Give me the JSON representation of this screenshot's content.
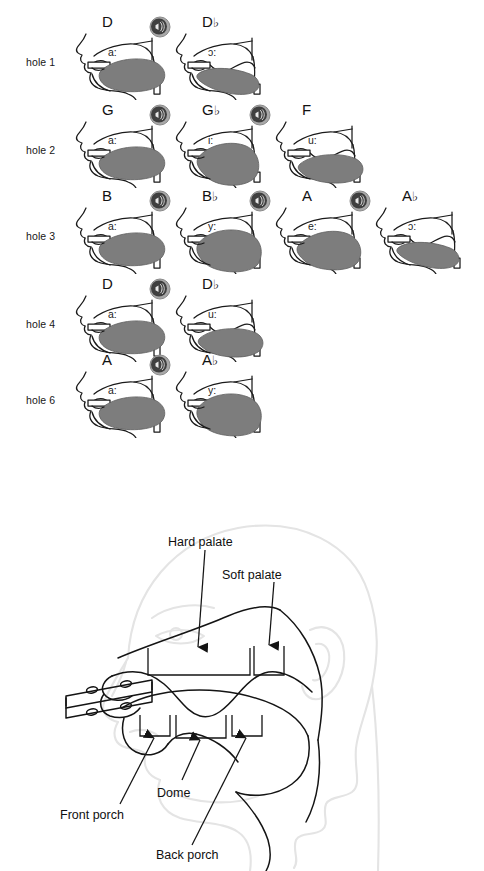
{
  "chart_data": {
    "type": "table",
    "row_header_label": "hole",
    "rows": [
      {
        "hole_label": "hole 1",
        "cells": [
          {
            "note": "D",
            "flat": false,
            "vowel": "a:",
            "speaker": false,
            "speaker_icon": "speaker-icon"
          },
          {
            "note": "D",
            "flat": true,
            "vowel": "ɔ:",
            "speaker": true,
            "speaker_icon": "speaker-icon"
          }
        ]
      },
      {
        "hole_label": "hole 2",
        "cells": [
          {
            "note": "G",
            "flat": false,
            "vowel": "a:",
            "speaker": false,
            "speaker_icon": "speaker-icon"
          },
          {
            "note": "G",
            "flat": true,
            "vowel": "i:",
            "speaker": true,
            "speaker_icon": "speaker-icon"
          },
          {
            "note": "F",
            "flat": false,
            "vowel": "u:",
            "speaker": true,
            "speaker_icon": "speaker-icon"
          }
        ]
      },
      {
        "hole_label": "hole 3",
        "cells": [
          {
            "note": "B",
            "flat": false,
            "vowel": "a:",
            "speaker": false,
            "speaker_icon": "speaker-icon"
          },
          {
            "note": "B",
            "flat": true,
            "vowel": "y:",
            "speaker": true,
            "speaker_icon": "speaker-icon"
          },
          {
            "note": "A",
            "flat": false,
            "vowel": "e:",
            "speaker": true,
            "speaker_icon": "speaker-icon"
          },
          {
            "note": "A",
            "flat": true,
            "vowel": "ɔ:",
            "speaker": true,
            "speaker_icon": "speaker-icon"
          }
        ]
      },
      {
        "hole_label": "hole 4",
        "cells": [
          {
            "note": "D",
            "flat": false,
            "vowel": "a:",
            "speaker": false,
            "speaker_icon": "speaker-icon"
          },
          {
            "note": "D",
            "flat": true,
            "vowel": "u:",
            "speaker": true,
            "speaker_icon": "speaker-icon"
          }
        ]
      },
      {
        "hole_label": "hole 6",
        "cells": [
          {
            "note": "A",
            "flat": false,
            "vowel": "a:",
            "speaker": false,
            "speaker_icon": "speaker-icon"
          },
          {
            "note": "A",
            "flat": true,
            "vowel": "y:",
            "speaker": true,
            "speaker_icon": "speaker-icon"
          }
        ]
      }
    ],
    "flat_glyph": "♭",
    "colors": {
      "tongue_fill": "#7d7d7d",
      "outline": "#111111",
      "speaker_body": "#9c9c9c",
      "head_outline_faint": "#e6e6e6"
    }
  },
  "anatomy": {
    "labels": {
      "hard_palate": "Hard palate",
      "soft_palate": "Soft palate",
      "dome": "Dome",
      "front_porch": "Front porch",
      "back_porch": "Back porch"
    }
  }
}
